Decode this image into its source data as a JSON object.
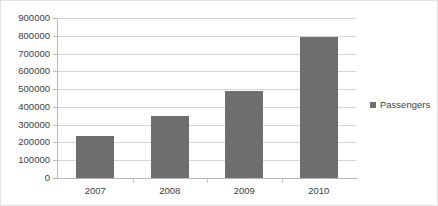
{
  "chart_data": {
    "type": "bar",
    "title": "",
    "subtitle": "",
    "xlabel": "",
    "ylabel": "",
    "categories": [
      "2007",
      "2008",
      "2009",
      "2010"
    ],
    "series": [
      {
        "name": "Passengers",
        "values": [
          235000,
          350000,
          490000,
          796000
        ],
        "color": "#6e6e6e"
      }
    ],
    "ylim": [
      0,
      900000
    ],
    "y_ticks": [
      900000,
      800000,
      700000,
      600000,
      500000,
      400000,
      300000,
      200000,
      100000,
      0
    ],
    "y_tick_labels": [
      "900000",
      "800000",
      "700000",
      "600000",
      "500000",
      "400000",
      "300000",
      "200000",
      "100000",
      "0"
    ],
    "x_tick_labels": [
      "2007",
      "2008",
      "2009",
      "2010"
    ],
    "grid": "horizontal",
    "legend_position": "right",
    "legend_entries": [
      "Passengers"
    ]
  },
  "legend": {
    "label": "Passengers",
    "marker": "square-marker-icon",
    "color": "#6e6e6e"
  },
  "colors": {
    "bar": "#6e6e6e",
    "gridline": "#d6d6d6",
    "axis": "#b9b9b9",
    "text": "#404040",
    "background": "#ffffff",
    "border": "#e3e3e3"
  }
}
